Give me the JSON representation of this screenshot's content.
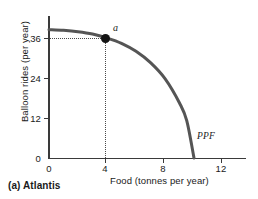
{
  "caption": "(a) Atlantis",
  "chart_data": {
    "type": "line",
    "title": "",
    "subtitle": "",
    "xlabel": "Food (tonnes per year)",
    "ylabel": "Balloon rides (per year)",
    "xlim": [
      0,
      13.6
    ],
    "ylim": [
      0,
      42.5
    ],
    "xticks": [
      0,
      4,
      8,
      12
    ],
    "xtick_labels": [
      "0",
      "4",
      "8",
      "12"
    ],
    "yticks": [
      0,
      12,
      24,
      36
    ],
    "ytick_labels": [
      "0",
      "12",
      "24",
      "36"
    ],
    "grid": false,
    "legend": null,
    "series": [
      {
        "name": "PPF",
        "label": "PPF",
        "color": "#555555",
        "x": [
          0,
          1,
          2,
          3,
          4,
          5,
          6,
          7,
          8,
          9,
          9.5,
          10
        ],
        "values": [
          38.5,
          38.3,
          37.9,
          37.2,
          36.0,
          34.4,
          32.0,
          28.6,
          23.8,
          16.5,
          11.2,
          0
        ]
      }
    ],
    "annotations": [
      {
        "name": "a",
        "label": "a",
        "x": 4,
        "y": 36,
        "marker": "filled-circle",
        "marker_color": "#141414",
        "guide_lines": "dotted-to-axes"
      },
      {
        "name": "PPF",
        "label": "PPF",
        "x": 11.2,
        "y": 8.0,
        "marker": "none"
      }
    ]
  },
  "axes": {
    "y_title": "Balloon rides (per year)",
    "x_title": "Food (tonnes per year)",
    "y_tick_labels": [
      "36",
      "24",
      "12",
      "0"
    ],
    "x_tick_labels": [
      "0",
      "4",
      "8",
      "12"
    ]
  },
  "colors": {
    "curve": "#555555",
    "axis": "#3a3a3a",
    "point": "#141414",
    "guide": "#4a4a4a",
    "text": "#1a1a1a",
    "background": "#ffffff"
  }
}
